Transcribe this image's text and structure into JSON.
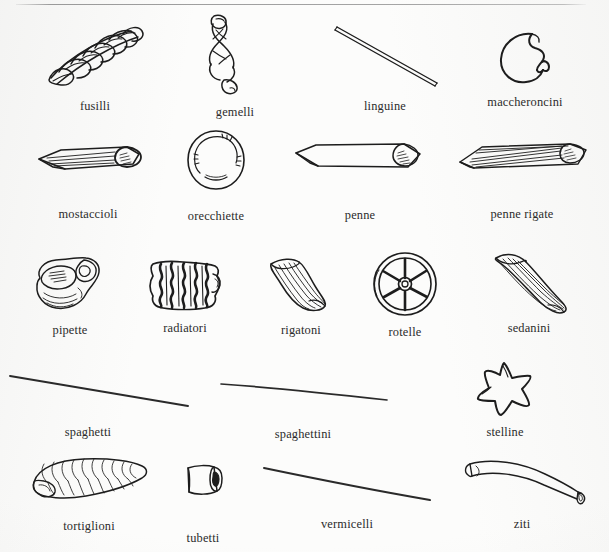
{
  "page": {
    "background_color": "#fcfcfb",
    "ink_color": "#1d1d1d",
    "label_color": "#2b2b2b",
    "rule_color": "#a5a5a5"
  },
  "rows": [
    {
      "index": 1,
      "items": [
        {
          "label": "fusilli",
          "icon": "fusilli-spiral-icon"
        },
        {
          "label": "gemelli",
          "icon": "gemelli-twist-icon"
        },
        {
          "label": "linguine",
          "icon": "linguine-strand-icon"
        },
        {
          "label": "maccheroncini",
          "icon": "maccheroncini-curve-icon"
        }
      ]
    },
    {
      "index": 2,
      "items": [
        {
          "label": "mostaccioli",
          "icon": "mostaccioli-tube-icon"
        },
        {
          "label": "orecchiette",
          "icon": "orecchiette-disc-icon"
        },
        {
          "label": "penne",
          "icon": "penne-tube-icon"
        },
        {
          "label": "penne rigate",
          "icon": "penne-rigate-ridged-tube-icon"
        }
      ]
    },
    {
      "index": 3,
      "items": [
        {
          "label": "pipette",
          "icon": "pipette-elbow-icon"
        },
        {
          "label": "radiatori",
          "icon": "radiatori-ruffle-icon"
        },
        {
          "label": "rigatoni",
          "icon": "rigatoni-ridged-tube-icon"
        },
        {
          "label": "rotelle",
          "icon": "rotelle-wheel-icon"
        },
        {
          "label": "sedanini",
          "icon": "sedanini-curved-tube-icon"
        }
      ]
    },
    {
      "index": 4,
      "items": [
        {
          "label": "spaghetti",
          "icon": "spaghetti-strand-icon"
        },
        {
          "label": "spaghettini",
          "icon": "spaghettini-strand-icon"
        },
        {
          "label": "stelline",
          "icon": "stelline-star-icon"
        }
      ]
    },
    {
      "index": 5,
      "items": [
        {
          "label": "tortiglioni",
          "icon": "tortiglioni-spiral-tube-icon"
        },
        {
          "label": "tubetti",
          "icon": "tubetti-short-tube-icon"
        },
        {
          "label": "vermicelli",
          "icon": "vermicelli-strand-icon"
        },
        {
          "label": "ziti",
          "icon": "ziti-tube-icon"
        }
      ]
    }
  ]
}
